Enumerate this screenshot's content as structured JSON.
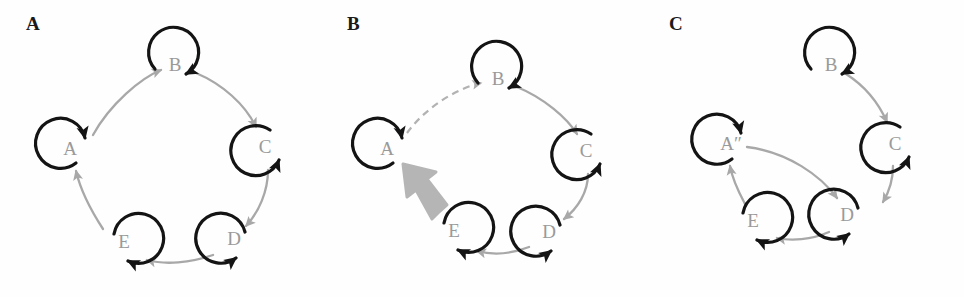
{
  "figure": {
    "type": "state-transition-diagram",
    "background_color": "#fefefe",
    "colors": {
      "self_loop_black": "#141414",
      "transition_gray": "#a8a8a8",
      "node_label_gray": "#9a9a9a",
      "panel_label_black": "#1a1a1a",
      "thick_arrow_gray": "#b5b5b5"
    },
    "panels": [
      {
        "id": "A",
        "label": "A",
        "label_x": 26,
        "label_y": 20,
        "nodes": [
          {
            "id": "A",
            "label": "A",
            "x": 70,
            "y": 150,
            "loop": "left"
          },
          {
            "id": "B",
            "label": "B",
            "x": 175,
            "y": 66,
            "loop": "top"
          },
          {
            "id": "C",
            "label": "C",
            "x": 265,
            "y": 148,
            "loop": "right"
          },
          {
            "id": "D",
            "label": "D",
            "x": 234,
            "y": 240,
            "loop": "bottom-right"
          },
          {
            "id": "E",
            "label": "E",
            "x": 124,
            "y": 243,
            "loop": "bottom-left"
          }
        ],
        "edges": [
          {
            "from": "A",
            "to": "B",
            "style": "solid",
            "weight": "normal"
          },
          {
            "from": "B",
            "to": "C",
            "style": "solid",
            "weight": "normal"
          },
          {
            "from": "C",
            "to": "D",
            "style": "solid",
            "weight": "normal"
          },
          {
            "from": "D",
            "to": "E",
            "style": "solid",
            "weight": "normal"
          },
          {
            "from": "E",
            "to": "A",
            "style": "solid",
            "weight": "normal"
          }
        ],
        "self_loops": [
          "A",
          "B",
          "C",
          "D",
          "E"
        ]
      },
      {
        "id": "B",
        "label": "B",
        "label_x": 26,
        "label_y": 20,
        "nodes": [
          {
            "id": "A",
            "label": "A",
            "x": 66,
            "y": 150,
            "loop": "left"
          },
          {
            "id": "B",
            "label": "B",
            "x": 177,
            "y": 80,
            "loop": "top"
          },
          {
            "id": "C",
            "label": "C",
            "x": 265,
            "y": 152,
            "loop": "right"
          },
          {
            "id": "D",
            "label": "D",
            "x": 228,
            "y": 233,
            "loop": "bottom-right"
          },
          {
            "id": "E",
            "label": "E",
            "x": 133,
            "y": 232,
            "loop": "bottom-left"
          }
        ],
        "edges": [
          {
            "from": "A",
            "to": "B",
            "style": "dashed",
            "weight": "normal"
          },
          {
            "from": "B",
            "to": "C",
            "style": "solid",
            "weight": "normal"
          },
          {
            "from": "C",
            "to": "D",
            "style": "solid",
            "weight": "normal"
          },
          {
            "from": "D",
            "to": "E",
            "style": "solid",
            "weight": "normal"
          },
          {
            "from": "E",
            "to": "A",
            "style": "solid",
            "weight": "thick"
          }
        ],
        "self_loops": [
          "A",
          "B",
          "C",
          "D",
          "E"
        ]
      },
      {
        "id": "C",
        "label": "C",
        "label_x": 26,
        "label_y": 20,
        "nodes": [
          {
            "id": "A",
            "label": "A″",
            "x": 84,
            "y": 145,
            "loop": "left"
          },
          {
            "id": "B",
            "label": "B",
            "x": 188,
            "y": 66,
            "loop": "top"
          },
          {
            "id": "C",
            "label": "C",
            "x": 252,
            "y": 145,
            "loop": "right"
          },
          {
            "id": "D",
            "label": "D",
            "x": 204,
            "y": 216,
            "loop": "bottom-right"
          },
          {
            "id": "E",
            "label": "E",
            "x": 110,
            "y": 222,
            "loop": "bottom-left"
          }
        ],
        "edges": [
          {
            "from": "A",
            "to": "D",
            "style": "solid",
            "weight": "normal"
          },
          {
            "from": "B",
            "to": "C",
            "style": "solid",
            "weight": "normal"
          },
          {
            "from": "C",
            "to": "D",
            "style": "solid",
            "weight": "normal"
          },
          {
            "from": "D",
            "to": "E",
            "style": "solid",
            "weight": "normal"
          },
          {
            "from": "E",
            "to": "A",
            "style": "solid",
            "weight": "normal"
          }
        ],
        "self_loops": [
          "A",
          "B",
          "C",
          "D",
          "E"
        ]
      }
    ]
  }
}
